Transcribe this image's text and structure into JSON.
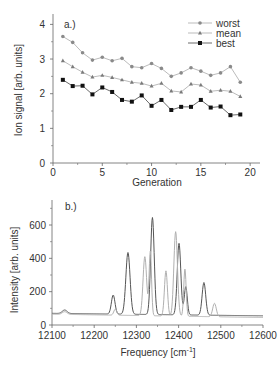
{
  "chart_data": [
    {
      "type": "line",
      "panel_label": "a.)",
      "title": "",
      "xlabel": "Generation",
      "ylabel": "Ion signal [arb. units]",
      "xlim": [
        0,
        21
      ],
      "ylim": [
        0,
        4.3
      ],
      "xticks": [
        0,
        5,
        10,
        15,
        20
      ],
      "yticks": [
        0,
        1,
        2,
        3,
        4
      ],
      "grid": false,
      "legend_position": "top-right",
      "x": [
        1,
        2,
        3,
        4,
        5,
        6,
        7,
        8,
        9,
        10,
        11,
        12,
        13,
        14,
        15,
        16,
        17,
        18,
        19
      ],
      "series": [
        {
          "name": "worst",
          "marker": "circle",
          "color": "#8a8a8a",
          "values": [
            3.65,
            3.48,
            3.18,
            2.97,
            3.05,
            2.95,
            3.02,
            2.78,
            2.75,
            2.87,
            2.73,
            2.5,
            2.6,
            2.75,
            2.65,
            2.53,
            2.6,
            2.78,
            2.33
          ]
        },
        {
          "name": "mean",
          "marker": "triangle",
          "color": "#7a7a7a",
          "values": [
            2.95,
            2.78,
            2.62,
            2.48,
            2.53,
            2.47,
            2.4,
            2.33,
            2.3,
            2.22,
            2.3,
            2.08,
            2.05,
            2.28,
            2.25,
            2.07,
            2.1,
            2.07,
            1.92
          ]
        },
        {
          "name": "best",
          "marker": "square",
          "color": "#111111",
          "values": [
            2.4,
            2.22,
            2.23,
            1.98,
            2.18,
            2.05,
            1.82,
            1.77,
            1.95,
            1.65,
            1.82,
            1.53,
            1.62,
            1.62,
            1.82,
            1.6,
            1.63,
            1.38,
            1.4
          ]
        }
      ]
    },
    {
      "type": "line",
      "panel_label": "b.)",
      "title": "",
      "xlabel": "Frequency [cm",
      "xlabel_sup": "-1",
      "xlabel_end": "]",
      "ylabel": "Intensity [arb. units]",
      "xlim": [
        12100,
        12600
      ],
      "ylim": [
        0,
        750
      ],
      "xticks": [
        12100,
        12200,
        12300,
        12400,
        12500,
        12600
      ],
      "yticks": [
        0,
        200,
        400,
        600
      ],
      "grid": false,
      "series": [
        {
          "name": "spectrum-dark",
          "color": "#555555",
          "peaks": [
            {
              "x": 12130,
              "y": 90,
              "w": 8
            },
            {
              "x": 12245,
              "y": 180,
              "w": 6
            },
            {
              "x": 12280,
              "y": 435,
              "w": 7
            },
            {
              "x": 12338,
              "y": 645,
              "w": 6
            },
            {
              "x": 12401,
              "y": 490,
              "w": 6
            },
            {
              "x": 12417,
              "y": 230,
              "w": 5
            },
            {
              "x": 12460,
              "y": 255,
              "w": 6
            }
          ],
          "baseline_left": 70,
          "baseline_right": 55
        },
        {
          "name": "spectrum-light",
          "color": "#b0b0b0",
          "peaks": [
            {
              "x": 12130,
              "y": 80,
              "w": 8
            },
            {
              "x": 12250,
              "y": 95,
              "w": 5
            },
            {
              "x": 12320,
              "y": 410,
              "w": 6
            },
            {
              "x": 12333,
              "y": 440,
              "w": 4
            },
            {
              "x": 12370,
              "y": 325,
              "w": 5
            },
            {
              "x": 12393,
              "y": 560,
              "w": 6
            },
            {
              "x": 12415,
              "y": 335,
              "w": 4
            },
            {
              "x": 12485,
              "y": 130,
              "w": 6
            }
          ],
          "baseline_left": 65,
          "baseline_right": 45
        }
      ]
    }
  ]
}
